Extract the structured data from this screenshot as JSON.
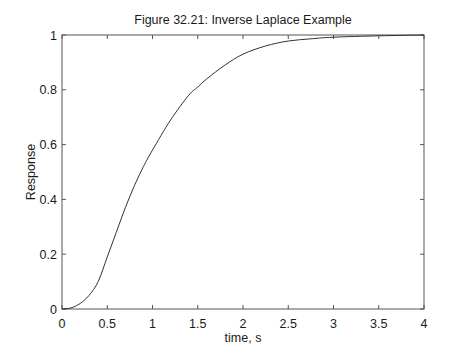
{
  "chart_data": {
    "type": "line",
    "title": "Figure 32.21: Inverse Laplace Example",
    "xlabel": "time, s",
    "ylabel": "Response",
    "xlim": [
      0,
      4
    ],
    "ylim": [
      0,
      1
    ],
    "grid": false,
    "legend": null,
    "xticks": [
      0,
      0.5,
      1,
      1.5,
      2,
      2.5,
      3,
      3.5,
      4
    ],
    "xtick_labels": [
      "0",
      "0.5",
      "1",
      "1.5",
      "2",
      "2.5",
      "3",
      "3.5",
      "4"
    ],
    "yticks": [
      0,
      0.2,
      0.4,
      0.6,
      0.8,
      1
    ],
    "ytick_labels": [
      "0",
      "0.2",
      "0.4",
      "0.6",
      "0.8",
      "1"
    ],
    "series": [
      {
        "name": "Response",
        "color": "#333333",
        "x": [
          0,
          0.1,
          0.2,
          0.3,
          0.4,
          0.5,
          0.6,
          0.7,
          0.8,
          0.9,
          1.0,
          1.2,
          1.4,
          1.5,
          1.6,
          1.8,
          2.0,
          2.25,
          2.5,
          2.75,
          3.0,
          3.5,
          4.0
        ],
        "y": [
          0,
          0.004,
          0.02,
          0.05,
          0.1,
          0.19,
          0.28,
          0.37,
          0.45,
          0.52,
          0.58,
          0.69,
          0.78,
          0.81,
          0.84,
          0.89,
          0.93,
          0.96,
          0.978,
          0.986,
          0.992,
          0.997,
          1.0
        ]
      }
    ]
  },
  "layout": {
    "plot_left": 62,
    "plot_right": 424,
    "plot_top": 35,
    "plot_bottom": 309,
    "axis_color": "#555555",
    "line_color": "#333333"
  }
}
